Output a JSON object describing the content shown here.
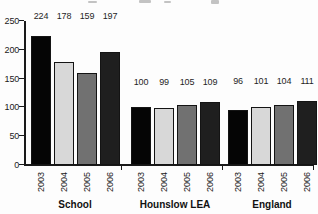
{
  "chart_data": {
    "type": "bar",
    "title": "",
    "xlabel": "",
    "ylabel": "",
    "ylim": [
      0,
      250
    ],
    "yticks": [
      "0",
      "50",
      "100",
      "150",
      "200",
      "250"
    ],
    "grid": false,
    "legend_position": "none",
    "value_labels_shown": true,
    "years": [
      "2003",
      "2004",
      "2005",
      "2006"
    ],
    "bar_colors": [
      "#050505",
      "#d8d8d8",
      "#717171",
      "#1f1f1f"
    ],
    "axis_color": "#1a1a1a",
    "groups": [
      {
        "label": "School",
        "values": [
          224,
          178,
          159,
          197
        ]
      },
      {
        "label": "Hounslow LEA",
        "values": [
          100,
          99,
          105,
          109
        ]
      },
      {
        "label": "England",
        "values": [
          96,
          101,
          104,
          111
        ]
      }
    ]
  }
}
